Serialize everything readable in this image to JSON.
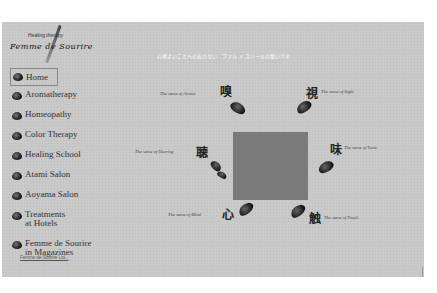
{
  "logo": {
    "subtitle": "Healing therapy",
    "name": "Femme de Sourire"
  },
  "tagline": "心地よいことへのおさない　ファム ド スリールの誓いです",
  "nav": {
    "items": [
      {
        "label": "Home",
        "active": true
      },
      {
        "label": "Aromatherapy"
      },
      {
        "label": "Homeopathy"
      },
      {
        "label": "Color Therapy"
      },
      {
        "label": "Healing School"
      },
      {
        "label": "Atami Salon"
      },
      {
        "label": "Aoyama Salon"
      },
      {
        "label": "Treatments at Hotels",
        "line1": "Treatments",
        "line2": "at Hotels"
      },
      {
        "label": "Femme de Sourire in Magazines",
        "line1": "Femme de Sourire",
        "line2": "in Magazines"
      }
    ],
    "footer_link": "Femme de Sourire Ltd..."
  },
  "senses": [
    {
      "kanji": "嗅",
      "label": "The sense of Aroma"
    },
    {
      "kanji": "視",
      "label": "The sense of Sight"
    },
    {
      "kanji": "聴",
      "label": "The sense of Hearing"
    },
    {
      "kanji": "味",
      "label": "The sense of Taste"
    },
    {
      "kanji": "心",
      "label": "The sense of Mind"
    },
    {
      "kanji": "触",
      "label": "The sense of Touch"
    }
  ],
  "colors": {
    "panel": "#c9c9c9",
    "center_square": "#7a7a7a",
    "tagline": "#ffffff"
  }
}
